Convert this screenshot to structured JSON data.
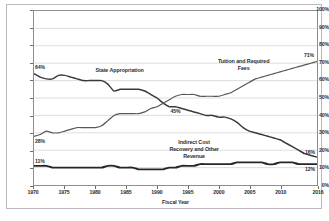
{
  "chart_data": {
    "type": "line",
    "title": "",
    "xlabel": "Fiscal Year",
    "ylabel": "",
    "xlim": [
      1970,
      2016
    ],
    "ylim": [
      0,
      100
    ],
    "grid": true,
    "legend_position": "inline-annotations",
    "y_ticks": [
      "0%",
      "10%",
      "20%",
      "30%",
      "40%",
      "50%",
      "60%",
      "70%",
      "80%",
      "90%",
      "100%"
    ],
    "y_tick_values": [
      0,
      10,
      20,
      30,
      40,
      50,
      60,
      70,
      80,
      90,
      100
    ],
    "x_ticks": [
      "1970",
      "1975",
      "1980",
      "1985",
      "1990",
      "1995",
      "2000",
      "2005",
      "2010",
      "2016"
    ],
    "x_tick_values": [
      1970,
      1975,
      1980,
      1985,
      1990,
      1995,
      2000,
      2005,
      2010,
      2016
    ],
    "x": [
      1970,
      1971,
      1972,
      1973,
      1974,
      1975,
      1976,
      1977,
      1978,
      1979,
      1980,
      1981,
      1982,
      1983,
      1984,
      1985,
      1986,
      1987,
      1988,
      1989,
      1990,
      1991,
      1992,
      1993,
      1994,
      1995,
      1996,
      1997,
      1998,
      1999,
      2000,
      2001,
      2002,
      2003,
      2004,
      2005,
      2006,
      2007,
      2008,
      2009,
      2010,
      2011,
      2012,
      2013,
      2014,
      2015,
      2016
    ],
    "series": [
      {
        "name": "State Appropriation",
        "color": "#3a3a3a",
        "start_label": "64%",
        "end_label": "16%",
        "values": [
          64,
          62,
          61,
          61,
          63,
          63,
          62,
          61,
          60,
          60,
          60,
          60,
          58,
          54,
          55,
          55,
          55,
          55,
          54,
          52,
          50,
          47,
          45,
          45,
          44,
          43,
          42,
          41,
          40,
          40,
          39,
          39,
          38,
          36,
          33,
          31,
          30,
          29,
          28,
          27,
          26,
          24,
          22,
          20,
          18,
          17,
          16
        ]
      },
      {
        "name": "Tuition and Required Fees",
        "color": "#585858",
        "start_label": "28%",
        "end_label": "71%",
        "values": [
          28,
          29,
          31,
          30,
          30,
          31,
          32,
          33,
          33,
          33,
          33,
          34,
          37,
          40,
          41,
          41,
          41,
          41,
          42,
          44,
          45,
          47,
          49,
          51,
          52,
          52,
          52,
          51,
          51,
          51,
          51,
          52,
          53,
          55,
          57,
          59,
          61,
          62,
          63,
          64,
          65,
          66,
          67,
          68,
          69,
          70,
          71
        ]
      },
      {
        "name": "Indirect Cost Recovery and Other Revenue",
        "color": "#262626",
        "start_label": "11%",
        "end_label": "12%",
        "values": [
          11,
          11,
          11,
          10,
          10,
          10,
          10,
          10,
          10,
          10,
          10,
          10,
          11,
          11,
          10,
          10,
          10,
          9,
          9,
          9,
          9,
          9,
          10,
          10,
          11,
          11,
          11,
          12,
          12,
          12,
          12,
          12,
          12,
          13,
          13,
          13,
          13,
          13,
          12,
          12,
          13,
          13,
          13,
          12,
          12,
          12,
          12
        ]
      }
    ],
    "annotations": [
      {
        "text": "State Appropriation",
        "x": 1984,
        "y": 66
      },
      {
        "text": "Tuition and Required Fees",
        "x": 2004,
        "y": 69
      },
      {
        "text": "Indirect Cost Recovery and Other Revenue",
        "x": 1995,
        "y": 22
      },
      {
        "text": "45%",
        "x": 1993,
        "y": 42
      }
    ],
    "crossover_label": "45%"
  }
}
